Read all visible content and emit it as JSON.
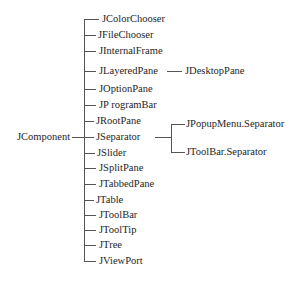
{
  "diagram": {
    "root": "JComponent",
    "children": [
      {
        "label": "JColorChooser"
      },
      {
        "label": "JFileChooser"
      },
      {
        "label": "JInternalFrame"
      },
      {
        "label": "JLayeredPane",
        "children": [
          {
            "label": "JDesktopPane"
          }
        ]
      },
      {
        "label": "JOptionPane"
      },
      {
        "label": "JP rogramBar"
      },
      {
        "label": "JRootPane"
      },
      {
        "label": "JSeparator",
        "children": [
          {
            "label": "JPopupMenu.Separator"
          },
          {
            "label": "JToolBar.Separator"
          }
        ]
      },
      {
        "label": "JSlider"
      },
      {
        "label": "JSplitPane"
      },
      {
        "label": "JTabbedPane"
      },
      {
        "label": "JTable"
      },
      {
        "label": "JToolBar"
      },
      {
        "label": "JToolTip"
      },
      {
        "label": "JTree"
      },
      {
        "label": "JViewPort"
      }
    ]
  }
}
